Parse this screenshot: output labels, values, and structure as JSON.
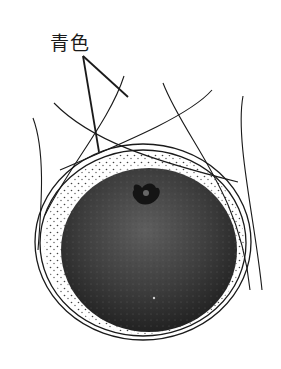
{
  "figure": {
    "label": "青色",
    "colors": {
      "background": "#ffffff",
      "ink": "#1a1a1a",
      "fruit_dark": "#2a2a2a",
      "fruit_light": "#5a5a5a"
    }
  }
}
